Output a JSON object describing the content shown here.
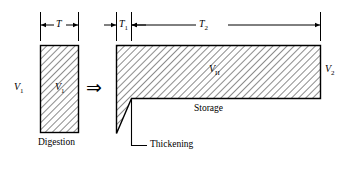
{
  "figure": {
    "kind": "engineering-dimension-diagram",
    "stroke_color": "#000000",
    "hatch_color": "#000000",
    "background": "#ffffff"
  },
  "dimensions": {
    "t": "T",
    "t1_base": "T",
    "t1_sub": "1",
    "t2_base": "T",
    "t2_sub": "2"
  },
  "volumes": {
    "v1_outer_base": "V",
    "v1_outer_sub": "1",
    "v1_inner_base": "V",
    "v1_inner_sub": "1",
    "v2_base": "V",
    "v2_sub": "II",
    "v2_outer_base": "V",
    "v2_outer_sub": "2"
  },
  "captions": {
    "digestion": "Digestion",
    "storage": "Storage",
    "thickening": "Thickening"
  },
  "symbols": {
    "implies": "⇒"
  }
}
